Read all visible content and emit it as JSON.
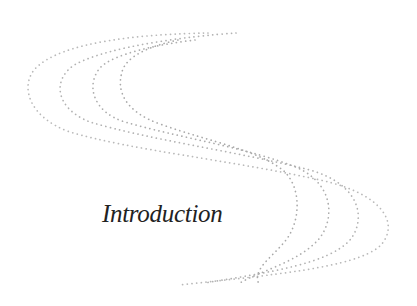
{
  "page": {
    "section_title": "Introduction"
  },
  "ornament": {
    "icon": "dotted-s-curve-ornament",
    "curve_count": 4,
    "dot_color": "#b4b4b4"
  },
  "colors": {
    "background": "#ffffff",
    "title_text": "#222222",
    "dots": "#b4b4b4"
  }
}
